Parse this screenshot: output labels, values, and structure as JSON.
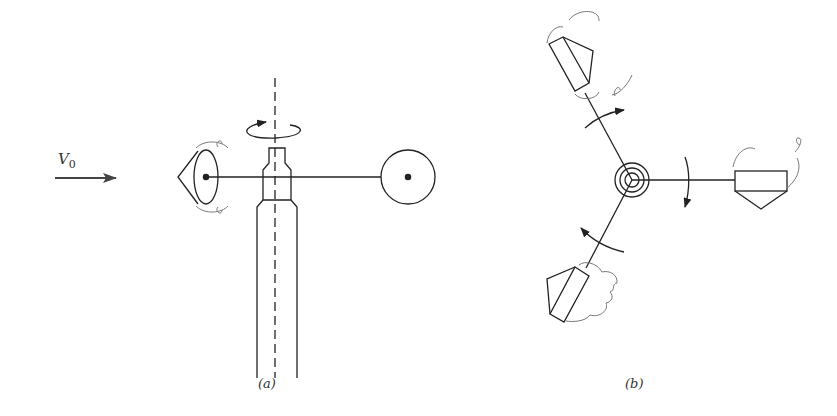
{
  "figure": {
    "panels": [
      {
        "id": "a",
        "caption": "(a)",
        "description": "Side view of cup anemometer facing wind V0"
      },
      {
        "id": "b",
        "caption": "(b)",
        "description": "Top view of three-cup anemometer rotor"
      }
    ],
    "labels": {
      "wind_symbol": "V",
      "wind_subscript": "0",
      "caption_a": "(a)",
      "caption_b": "(b)"
    },
    "colors": {
      "stroke": "#222222",
      "eddy": "#777777",
      "arrow": "#444444"
    }
  }
}
